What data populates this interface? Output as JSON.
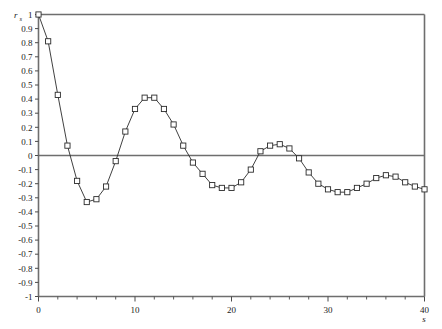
{
  "chart_data": {
    "type": "line",
    "title": "",
    "subtitle": "",
    "xlabel": "s",
    "ylabel": "r_s",
    "ylabel_base": "r",
    "ylabel_sub": "s",
    "xlim": [
      0,
      40
    ],
    "ylim": [
      -1,
      1
    ],
    "grid": false,
    "legend": "none",
    "marker": "open-square",
    "line_color": "#2b2b2b",
    "marker_fill": "#ffffff",
    "axis_color": "#6e6e6e",
    "zero_reference_line": 0,
    "x_major_ticks": [
      0,
      10,
      20,
      30,
      40
    ],
    "x_major_tick_labels": [
      "0",
      "10",
      "20",
      "30",
      "40"
    ],
    "x_minor_tick_step": 2,
    "y_ticks": [
      1,
      0.9,
      0.8,
      0.7,
      0.6,
      0.5,
      0.4,
      0.3,
      0.2,
      0.1,
      0,
      -0.1,
      -0.2,
      -0.3,
      -0.4,
      -0.5,
      -0.6,
      -0.7,
      -0.8,
      -0.9,
      -1
    ],
    "y_tick_labels": [
      "1",
      "0.9",
      "0.8",
      "0.7",
      "0.6",
      "0.5",
      "0.4",
      "0.3",
      "0.2",
      "0.1",
      "0",
      "-0.1",
      "-0.2",
      "-0.3",
      "-0.4",
      "-0.5",
      "-0.6",
      "-0.7",
      "-0.8",
      "-0.9",
      "-1"
    ],
    "x": [
      0,
      1,
      2,
      3,
      4,
      5,
      6,
      7,
      8,
      9,
      10,
      11,
      12,
      13,
      14,
      15,
      16,
      17,
      18,
      19,
      20,
      21,
      22,
      23,
      24,
      25,
      26,
      27,
      28,
      29,
      30,
      31,
      32,
      33,
      34,
      35,
      36,
      37,
      38,
      39,
      40
    ],
    "values": [
      1.0,
      0.81,
      0.43,
      0.07,
      -0.18,
      -0.33,
      -0.31,
      -0.22,
      -0.04,
      0.17,
      0.33,
      0.41,
      0.41,
      0.33,
      0.22,
      0.07,
      -0.05,
      -0.13,
      -0.21,
      -0.23,
      -0.23,
      -0.19,
      -0.1,
      0.03,
      0.07,
      0.08,
      0.05,
      -0.02,
      -0.12,
      -0.2,
      -0.24,
      -0.26,
      -0.26,
      -0.23,
      -0.2,
      -0.16,
      -0.14,
      -0.15,
      -0.19,
      -0.22,
      -0.24
    ]
  }
}
